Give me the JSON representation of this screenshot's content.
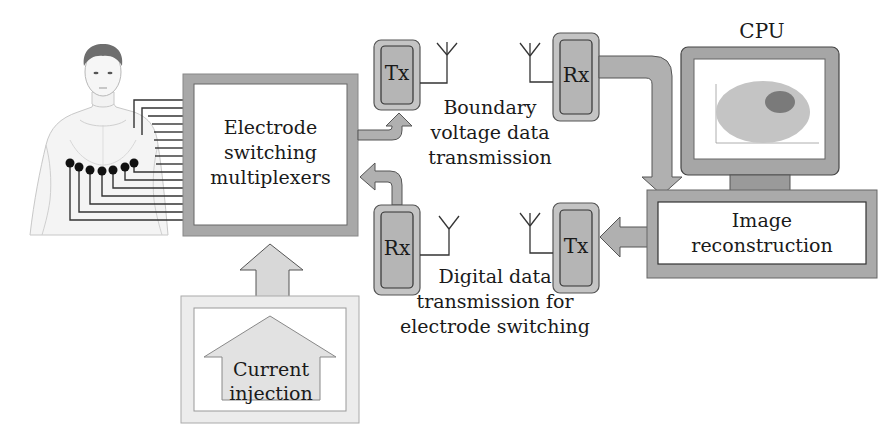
{
  "diagram": {
    "colors": {
      "box_border_gray": "#a8a8a8",
      "unit_fill": "#b5b5b5",
      "arrow_fill": "#b0b0b0",
      "light_gray": "#d8d8d8",
      "monitor_gray": "#a0a0a0",
      "ellipse_light": "#c4c4c4",
      "ellipse_dark": "#7a7a7a",
      "line": "#222222"
    },
    "nodes": {
      "patient": {
        "label": "Patient torso with electrode belt",
        "electrode_count": 7
      },
      "multiplexer": {
        "label_lines": [
          "Electrode",
          "switching",
          "multiplexers"
        ]
      },
      "current_injection": {
        "label_lines": [
          "Current",
          "injection"
        ]
      },
      "tx_left": {
        "label": "Tx"
      },
      "rx_left": {
        "label": "Rx"
      },
      "rx_right": {
        "label": "Rx"
      },
      "tx_right": {
        "label": "Tx"
      },
      "cpu": {
        "label": "CPU"
      },
      "image_reconstruction": {
        "label_lines": [
          "Image",
          "reconstruction"
        ]
      }
    },
    "annotations": {
      "boundary": [
        "Boundary",
        "voltage data",
        "transmission"
      ],
      "digital": [
        "Digital data",
        "transmission for",
        "electrode switching"
      ]
    },
    "edges": [
      {
        "from": "multiplexer",
        "to": "tx_left"
      },
      {
        "from": "rx_left",
        "to": "multiplexer"
      },
      {
        "from": "rx_right",
        "to": "image_reconstruction"
      },
      {
        "from": "image_reconstruction",
        "to": "tx_right"
      },
      {
        "from": "current_injection",
        "to": "multiplexer"
      }
    ]
  }
}
